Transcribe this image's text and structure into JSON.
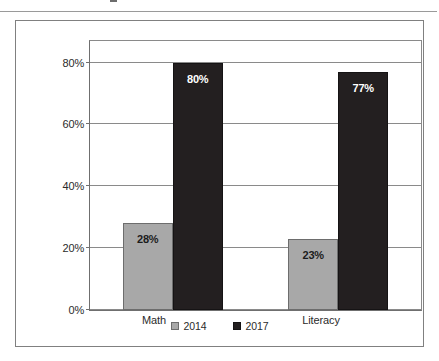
{
  "chart_data": {
    "type": "bar",
    "title": "",
    "subtitle": "",
    "xlabel": "",
    "ylabel": "",
    "categories": [
      "Math",
      "Literacy"
    ],
    "series": [
      {
        "name": "2014",
        "color": "#a8a8a8",
        "values": [
          28,
          23
        ],
        "value_labels": [
          "28%",
          "23%"
        ]
      },
      {
        "name": "2017",
        "color": "#231f20",
        "values": [
          80,
          77
        ],
        "value_labels": [
          "80%",
          "77%"
        ]
      }
    ],
    "ylim": [
      0,
      87
    ],
    "yticks": [
      0,
      20,
      40,
      60,
      80
    ],
    "ytick_labels": [
      "0%",
      "20%",
      "40%",
      "60%",
      "80%"
    ],
    "grid": true,
    "legend_position": "bottom",
    "value_labels_inside_bars": true
  },
  "legend": {
    "items": [
      {
        "label": "2014",
        "swatch": "gray-square-swatch"
      },
      {
        "label": "2017",
        "swatch": "black-square-swatch"
      }
    ]
  }
}
